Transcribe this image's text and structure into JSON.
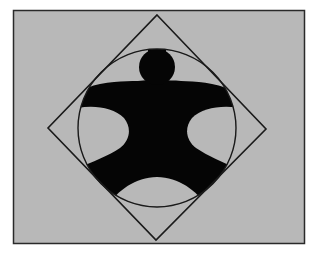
{
  "figure": {
    "colors": {
      "page_background": "#ffffff",
      "panel_fill": "#b8b8b8",
      "panel_border": "#2a2a2a",
      "line": "#1a1a1a",
      "figure_fill": "#050505"
    },
    "panel": {
      "x": 13,
      "y": 10,
      "width": 291,
      "height": 233
    },
    "diamond": {
      "top": [
        157,
        15
      ],
      "right": [
        266,
        129
      ],
      "bottom": [
        156,
        240
      ],
      "left": [
        48,
        128
      ]
    },
    "circle": {
      "cx": 157,
      "cy": 128,
      "r": 79
    },
    "head": {
      "cx": 157,
      "cy": 67,
      "r": 18
    }
  }
}
